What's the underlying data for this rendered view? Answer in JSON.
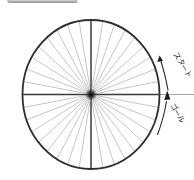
{
  "labels": {
    "start": "スタート",
    "goal": "ゴール"
  },
  "wheel": {
    "spoke_count": 36,
    "spoke_interval_deg": 10,
    "axis_angles_deg": [
      0,
      90,
      180,
      270
    ]
  },
  "colors": {
    "outline": "#2e2e2e",
    "spoke": "#a6a6a6",
    "axis": "#3a3a3a",
    "arrow": "#1e1e1e",
    "label_text": "#222222",
    "topbar": "#b5b5b5",
    "background": "#ffffff"
  }
}
